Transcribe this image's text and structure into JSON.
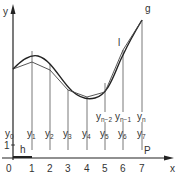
{
  "diagram": {
    "axes": {
      "x_label": "x",
      "y_label": "y",
      "origin_label": "0",
      "y_unit_label": "1"
    },
    "x_ticks": [
      "1",
      "2",
      "3",
      "4",
      "5",
      "6",
      "7"
    ],
    "ordinates_lower": [
      {
        "base": "y",
        "sub": "0"
      },
      {
        "base": "y",
        "sub": "1"
      },
      {
        "base": "y",
        "sub": "2"
      },
      {
        "base": "y",
        "sub": "3"
      },
      {
        "base": "y",
        "sub": "4"
      },
      {
        "base": "y",
        "sub": "5"
      },
      {
        "base": "y",
        "sub": "6"
      },
      {
        "base": "y",
        "sub": "7"
      }
    ],
    "ordinates_upper": [
      {
        "base": "y",
        "sub": "n−2"
      },
      {
        "base": "y",
        "sub": "n−1"
      },
      {
        "base": "y",
        "sub": "n"
      }
    ],
    "labels": {
      "step": "h",
      "curve": "g",
      "polygon": "l",
      "point": "P"
    },
    "colors": {
      "line": "#333333",
      "background": "#ffffff"
    }
  }
}
